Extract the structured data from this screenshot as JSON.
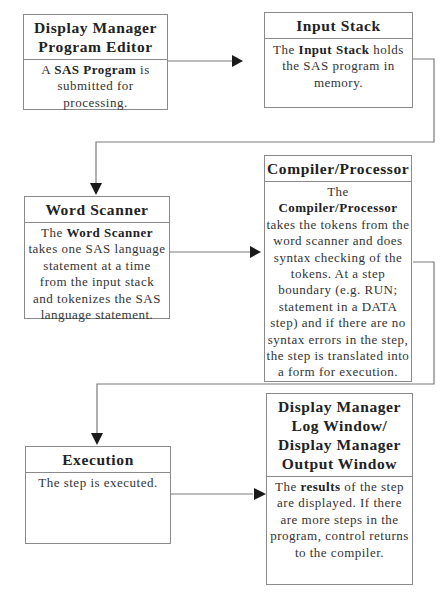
{
  "diagram": {
    "boxes": [
      {
        "id": "display-manager-program-editor",
        "title": "Display Manager Program Editor",
        "title_lines": [
          "Display Manager",
          "Program Editor"
        ],
        "body": [
          {
            "text": "A ",
            "bold": false
          },
          {
            "text": "SAS Program",
            "bold": true
          },
          {
            "text": " is submitted for processing.",
            "bold": false
          }
        ]
      },
      {
        "id": "input-stack",
        "title": "Input Stack",
        "title_lines": [
          "Input Stack"
        ],
        "body": [
          {
            "text": "The ",
            "bold": false
          },
          {
            "text": "Input Stack",
            "bold": true
          },
          {
            "text": " holds the SAS program in memory.",
            "bold": false
          }
        ]
      },
      {
        "id": "word-scanner",
        "title": "Word Scanner",
        "title_lines": [
          "Word Scanner"
        ],
        "body": [
          {
            "text": "The ",
            "bold": false
          },
          {
            "text": "Word Scanner",
            "bold": true
          },
          {
            "text": " takes one SAS language statement at a time from the input stack and tokenizes the SAS language statement.",
            "bold": false
          }
        ]
      },
      {
        "id": "compiler-processor",
        "title": "Compiler/Processor",
        "title_lines": [
          "Compiler/Processor"
        ],
        "body": [
          {
            "text": "The ",
            "bold": false
          },
          {
            "text": "Compiler/Processor",
            "bold": true
          },
          {
            "text": " takes the tokens from the word scanner and does syntax checking of the tokens.  At a step boundary  (e.g. RUN; statement in a DATA step) and if there are no syntax errors in the step, the step is translated into a form for execution.",
            "bold": false
          }
        ]
      },
      {
        "id": "execution",
        "title": "Execution",
        "title_lines": [
          "Execution"
        ],
        "body": [
          {
            "text": "The step is executed.",
            "bold": false
          }
        ]
      },
      {
        "id": "display-manager-log-output-window",
        "title": "Display Manager Log Window/ Display Manager Output Window",
        "title_lines": [
          "Display Manager",
          "Log Window/",
          "Display Manager",
          "Output Window"
        ],
        "body": [
          {
            "text": "The ",
            "bold": false
          },
          {
            "text": "results",
            "bold": true
          },
          {
            "text": " of the step are displayed.  If there are more steps in the program, control returns to the compiler.",
            "bold": false
          }
        ]
      }
    ],
    "connectors": [
      {
        "from": "display-manager-program-editor",
        "to": "input-stack"
      },
      {
        "from": "input-stack",
        "to": "word-scanner"
      },
      {
        "from": "word-scanner",
        "to": "compiler-processor"
      },
      {
        "from": "compiler-processor",
        "to": "execution"
      },
      {
        "from": "execution",
        "to": "display-manager-log-output-window"
      }
    ],
    "colors": {
      "line": "#7a7a7a",
      "arrow": "#1a1a1a",
      "border": "#8a8a8a",
      "text": "#2a2a2a"
    }
  }
}
